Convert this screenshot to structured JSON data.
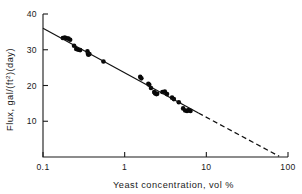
{
  "chart_data": {
    "type": "scatter",
    "title": "",
    "xlabel": "Yeast concentration, vol %",
    "ylabel": "Flux, gal/(ft²)(day)",
    "ylabel_parts": {
      "pre": "Flux, gal/(ft",
      "sup": "2",
      "post": ")(day)"
    },
    "xscale": "log",
    "yscale": "linear",
    "xlim": [
      0.1,
      100
    ],
    "ylim": [
      0,
      40
    ],
    "grid": false,
    "legend": null,
    "xticks": [
      0.1,
      1,
      10,
      100
    ],
    "xticklabels": [
      "0.1",
      "1",
      "10",
      "100"
    ],
    "yticks": [
      10,
      20,
      30,
      40
    ],
    "yticklabels": [
      "10",
      "20",
      "30",
      "40"
    ],
    "series": [
      {
        "name": "Measured flux",
        "type": "scatter",
        "marker": "filled-circle",
        "color": "#080808",
        "points": [
          [
            0.175,
            33.3
          ],
          [
            0.185,
            33.4
          ],
          [
            0.195,
            33.2
          ],
          [
            0.205,
            33.1
          ],
          [
            0.215,
            32.8
          ],
          [
            0.24,
            31.1
          ],
          [
            0.255,
            30.2
          ],
          [
            0.27,
            30.0
          ],
          [
            0.285,
            29.9
          ],
          [
            0.35,
            29.6
          ],
          [
            0.355,
            28.9
          ],
          [
            0.36,
            28.6
          ],
          [
            0.37,
            28.8
          ],
          [
            0.55,
            26.7
          ],
          [
            1.55,
            22.4
          ],
          [
            1.6,
            22.0
          ],
          [
            1.95,
            20.5
          ],
          [
            2.0,
            20.2
          ],
          [
            2.1,
            19.3
          ],
          [
            2.3,
            18.2
          ],
          [
            2.35,
            17.8
          ],
          [
            2.45,
            17.6
          ],
          [
            2.5,
            17.7
          ],
          [
            2.9,
            18.2
          ],
          [
            3.1,
            18.3
          ],
          [
            3.3,
            17.6
          ],
          [
            3.8,
            16.6
          ],
          [
            4.0,
            16.2
          ],
          [
            4.6,
            15.3
          ],
          [
            5.2,
            13.6
          ],
          [
            5.5,
            13.0
          ],
          [
            5.8,
            12.9
          ],
          [
            6.1,
            13.1
          ],
          [
            6.4,
            12.9
          ]
        ]
      },
      {
        "name": "Correlation line (fitted)",
        "type": "line",
        "style": "solid",
        "color": "#111111",
        "points": [
          [
            0.1,
            36.0
          ],
          [
            8.0,
            12.3
          ]
        ]
      },
      {
        "name": "Correlation line (extrapolated)",
        "type": "line",
        "style": "dashed",
        "color": "#111111",
        "points": [
          [
            8.0,
            12.3
          ],
          [
            78.0,
            0.2
          ]
        ]
      }
    ]
  }
}
